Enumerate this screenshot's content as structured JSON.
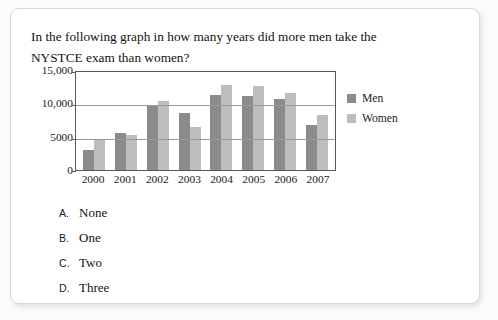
{
  "question": {
    "text": "In the following graph in how many years did more men take the NYSTCE exam than women?"
  },
  "chart_data": {
    "type": "bar",
    "title": "",
    "xlabel": "",
    "ylabel": "",
    "categories": [
      "2000",
      "2001",
      "2002",
      "2003",
      "2004",
      "2005",
      "2006",
      "2007"
    ],
    "series": [
      {
        "name": "Men",
        "color": "#8b8b8b",
        "values": [
          3000,
          5600,
          9800,
          8500,
          11300,
          11100,
          10600,
          6800
        ]
      },
      {
        "name": "Women",
        "color": "#bdbdbd",
        "values": [
          4500,
          5300,
          10400,
          6500,
          12700,
          12600,
          11600,
          8300
        ]
      }
    ],
    "ylim": [
      0,
      15000
    ],
    "yticks": [
      0,
      5000,
      10000,
      15000
    ],
    "ytick_labels": [
      "0",
      "5000",
      "10,000",
      "15,000"
    ],
    "grid": true,
    "legend_position": "right"
  },
  "options": [
    {
      "letter": "A.",
      "text": "None"
    },
    {
      "letter": "B.",
      "text": "One"
    },
    {
      "letter": "C.",
      "text": "Two"
    },
    {
      "letter": "D.",
      "text": "Three"
    }
  ]
}
